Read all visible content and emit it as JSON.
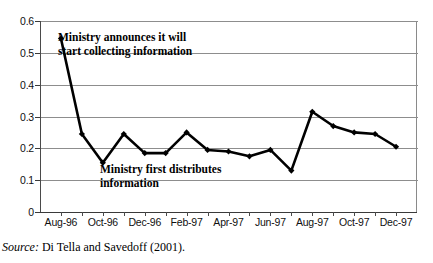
{
  "figure": {
    "source_label": "Source:",
    "source_text": " Di Tella and Savedoff (2001)."
  },
  "annotations": [
    {
      "name": "ministry-announces",
      "text": "Ministry announces it will\nstart collecting information"
    },
    {
      "name": "ministry-distributes",
      "text": "Ministry first distributes\ninformation"
    }
  ],
  "chart_data": {
    "type": "line",
    "title": "",
    "subtitle": "",
    "xlabel": "",
    "ylabel": "",
    "grid": true,
    "legend": "none",
    "ylim": [
      0,
      0.6
    ],
    "ytick_labels": [
      "0",
      "0.1",
      "0.2",
      "0.3",
      "0.4",
      "0.5",
      "0.6"
    ],
    "ytick_values": [
      0,
      0.1,
      0.2,
      0.3,
      0.4,
      0.5,
      0.6
    ],
    "xtick_labels": [
      "Aug-96",
      "Oct-96",
      "Dec-96",
      "Feb-97",
      "Apr-97",
      "Jun-97",
      "Aug-97",
      "Oct-97",
      "Dec-97"
    ],
    "x": [
      "Aug-96",
      "Sep-96",
      "Oct-96",
      "Nov-96",
      "Dec-96",
      "Jan-97",
      "Feb-97",
      "Mar-97",
      "Apr-97",
      "May-97",
      "Jun-97",
      "Jul-97",
      "Aug-97",
      "Sep-97",
      "Oct-97",
      "Nov-97",
      "Dec-97"
    ],
    "values": [
      0.545,
      0.245,
      0.155,
      0.245,
      0.185,
      0.185,
      0.25,
      0.195,
      0.19,
      0.175,
      0.195,
      0.13,
      0.315,
      0.27,
      0.25,
      0.245,
      0.205
    ],
    "series": [
      {
        "name": "Prices",
        "marker": "diamond",
        "color": "#000000",
        "values": [
          0.545,
          0.245,
          0.155,
          0.245,
          0.185,
          0.185,
          0.25,
          0.195,
          0.19,
          0.175,
          0.195,
          0.13,
          0.315,
          0.27,
          0.25,
          0.245,
          0.205
        ]
      }
    ],
    "annotation_points": [
      {
        "label": "Ministry announces it will start collecting information",
        "x": "Aug-96",
        "y": 0.545
      },
      {
        "label": "Ministry first distributes information",
        "x": "Dec-96",
        "y": 0.185
      }
    ]
  }
}
